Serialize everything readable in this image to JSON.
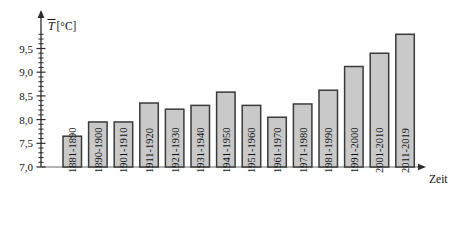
{
  "chart_data": {
    "type": "bar",
    "title": "",
    "subtitle": "",
    "xlabel": "Zeit",
    "ylabel": "T̄[°C]",
    "ylabel_symbol": "T",
    "ylabel_unit": "[°C]",
    "categories": [
      "1881-1890",
      "1890-1900",
      "1901-1910",
      "1911-1920",
      "1921-1930",
      "1931-1940",
      "1941-1950",
      "1951-1960",
      "1961-1970",
      "1971-1980",
      "1981-1990",
      "1991-2000",
      "2001-2010",
      "2011-2019"
    ],
    "values": [
      7.65,
      7.95,
      7.95,
      8.35,
      8.22,
      8.3,
      8.58,
      8.3,
      8.05,
      8.33,
      8.62,
      9.12,
      9.4,
      9.8
    ],
    "ylim": [
      7.0,
      9.85
    ],
    "ytick_labels": [
      "7,0",
      "7,5",
      "8,0",
      "8,5",
      "9,0",
      "9,5"
    ],
    "ytick_values": [
      7.0,
      7.5,
      8.0,
      8.5,
      9.0,
      9.5
    ],
    "yminor_step": 0.1,
    "grid": false,
    "legend": false,
    "bar_fill_color": "#c9c9c9",
    "bar_border_color": "#3a3a3a",
    "axis_color": "#2b2b2b",
    "baseline_color": "#9a9a9a",
    "background_color": "#ffffff"
  }
}
